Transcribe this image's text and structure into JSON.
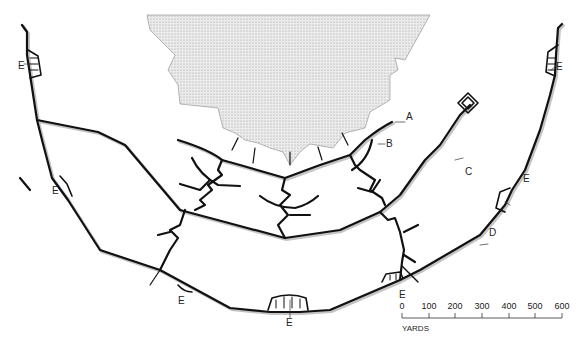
{
  "diagram": {
    "type": "trench-system-plan",
    "colors": {
      "trench": "#111111",
      "shadow": "#bbbbbb",
      "stipple_fill": "#d8d8d8",
      "stipple_edge": "#888888"
    }
  },
  "labels": {
    "A": "A",
    "B": "B",
    "C": "C",
    "D": "D",
    "E": "E"
  },
  "scale": {
    "ticks": [
      "0",
      "100",
      "200",
      "300",
      "400",
      "500",
      "600"
    ],
    "unit": "YARDS"
  }
}
